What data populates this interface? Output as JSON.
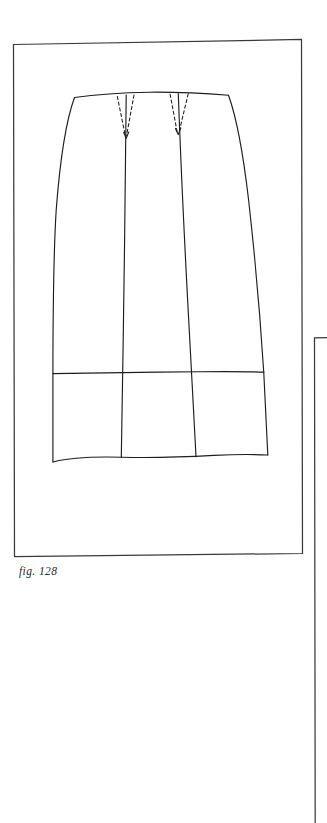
{
  "page": {
    "background_color": "#ffffff",
    "ink_color": "#2b2b2b",
    "width": 327,
    "height": 823
  },
  "figure": {
    "caption": "fig. 128",
    "frame": {
      "name": "figure-frame",
      "stroke_color": "#3a3a3a",
      "corners": {
        "top_left": [
          13,
          44
        ],
        "top_right": [
          301,
          39
        ],
        "bottom_right": [
          302,
          553
        ],
        "bottom_left": [
          14,
          556
        ]
      }
    },
    "next_frame": {
      "name": "next-figure-frame-partial",
      "stroke_color": "#3a3a3a",
      "top_left": [
        314,
        337
      ],
      "note": "partially visible frame at right page edge, cropped"
    },
    "drawing": {
      "stroke_color": "#1d1d1d",
      "waist": {
        "left": [
          74,
          97
        ],
        "mid_dip": [
          150,
          92
        ],
        "right": [
          228,
          95
        ]
      },
      "hem": {
        "left": [
          53,
          462
        ],
        "right": [
          268,
          455
        ]
      },
      "band_line_y": 373,
      "darts": [
        {
          "name": "left-dart",
          "top_left": [
            117,
            96
          ],
          "top_right": [
            134,
            95
          ],
          "point": [
            126,
            137
          ]
        },
        {
          "name": "right-dart",
          "top_left": [
            170,
            94
          ],
          "top_right": [
            188,
            94
          ],
          "point": [
            178,
            133
          ]
        }
      ],
      "seams": [
        {
          "name": "left-panel-seam",
          "top": [
            126,
            96
          ],
          "bottom": [
            121,
            461
          ]
        },
        {
          "name": "right-panel-seam",
          "top": [
            178,
            95
          ],
          "bottom": [
            196,
            459
          ]
        }
      ]
    }
  }
}
